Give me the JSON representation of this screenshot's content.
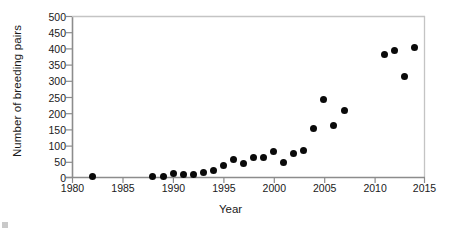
{
  "chart_data": {
    "type": "scatter",
    "title": "",
    "xlabel": "Year",
    "ylabel": "Number of breeding pairs",
    "xlim": [
      1980,
      2015
    ],
    "ylim": [
      0,
      500
    ],
    "xticks": [
      1980,
      1985,
      1990,
      1995,
      2000,
      2005,
      2010,
      2015
    ],
    "yticks": [
      0,
      50,
      100,
      150,
      200,
      250,
      300,
      350,
      400,
      450,
      500
    ],
    "grid": false,
    "legend": null,
    "marker": {
      "shape": "circle",
      "color": "#0a0a0a",
      "size": 7
    },
    "x": [
      1982,
      1988,
      1989,
      1990,
      1991,
      1992,
      1993,
      1994,
      1995,
      1996,
      1997,
      1998,
      1999,
      2000,
      2001,
      2002,
      2003,
      2004,
      2005,
      2006,
      2007,
      2011,
      2012,
      2013,
      2014
    ],
    "y": [
      2,
      2,
      3,
      11,
      10,
      9,
      15,
      22,
      36,
      57,
      44,
      63,
      61,
      80,
      48,
      75,
      85,
      151,
      242,
      163,
      208,
      383,
      393,
      313,
      403
    ],
    "series": [
      {
        "name": "Breeding pairs",
        "points": [
          {
            "x": 1982,
            "y": 2
          },
          {
            "x": 1988,
            "y": 2
          },
          {
            "x": 1989,
            "y": 3
          },
          {
            "x": 1990,
            "y": 11
          },
          {
            "x": 1991,
            "y": 10
          },
          {
            "x": 1992,
            "y": 9
          },
          {
            "x": 1993,
            "y": 15
          },
          {
            "x": 1994,
            "y": 22
          },
          {
            "x": 1995,
            "y": 36
          },
          {
            "x": 1996,
            "y": 57
          },
          {
            "x": 1997,
            "y": 44
          },
          {
            "x": 1998,
            "y": 63
          },
          {
            "x": 1999,
            "y": 61
          },
          {
            "x": 2000,
            "y": 80
          },
          {
            "x": 2001,
            "y": 48
          },
          {
            "x": 2002,
            "y": 75
          },
          {
            "x": 2003,
            "y": 85
          },
          {
            "x": 2004,
            "y": 151
          },
          {
            "x": 2005,
            "y": 242
          },
          {
            "x": 2006,
            "y": 163
          },
          {
            "x": 2007,
            "y": 208
          },
          {
            "x": 2011,
            "y": 383
          },
          {
            "x": 2012,
            "y": 393
          },
          {
            "x": 2013,
            "y": 313
          },
          {
            "x": 2014,
            "y": 403
          }
        ]
      }
    ]
  },
  "axes": {
    "y_title": "Number of breeding pairs",
    "x_title": "Year",
    "y_tick_labels": [
      "500",
      "450",
      "400",
      "350",
      "300",
      "250",
      "200",
      "150",
      "100",
      "50",
      "0"
    ],
    "x_tick_labels": [
      "1980",
      "1985",
      "1990",
      "1995",
      "2000",
      "2005",
      "2010",
      "2015"
    ]
  },
  "colors": {
    "marker": "#0a0a0a",
    "axis": "#8c8c8c",
    "text": "#1a1a1a",
    "background": "#ffffff"
  }
}
